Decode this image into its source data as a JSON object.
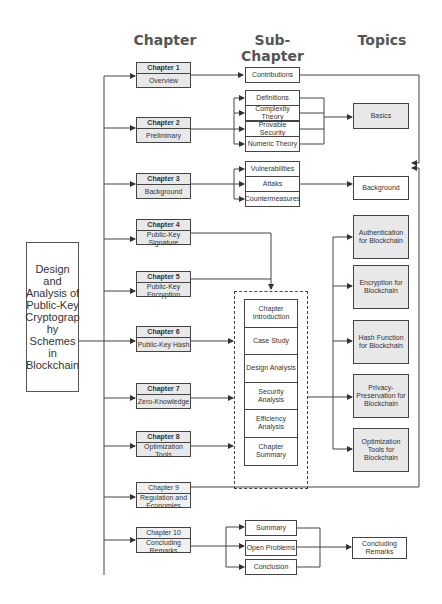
{
  "headers": {
    "chapter": "Chapter",
    "subchapter": "Sub-Chapter",
    "topics": "Topics"
  },
  "main_title": "Design and Analysis of Public-Key Cryptograp hy Schemes in Blockchain",
  "chapters": [
    {
      "title": "Chapter 1",
      "subtitle": "Overview"
    },
    {
      "title": "Chapter 2",
      "subtitle": "Preliminary"
    },
    {
      "title": "Chapter 3",
      "subtitle": "Background"
    },
    {
      "title": "Chapter 4",
      "subtitle": "Public-Key Signature"
    },
    {
      "title": "Chapter 5",
      "subtitle": "Public-Key Encryption"
    },
    {
      "title": "Chapter 6",
      "subtitle": "Public-Key Hash"
    },
    {
      "title": "Chapter 7",
      "subtitle": "Zero-Knowledge"
    },
    {
      "title": "Chapter 8",
      "subtitle": "Optimization Tools"
    },
    {
      "title": "Chapter 9",
      "subtitle": "Regulation and Economies"
    },
    {
      "title": "Chapter 10",
      "subtitle": "Concluding Remarks"
    }
  ],
  "subchapters": {
    "ch1": [
      "Contributions"
    ],
    "ch2": [
      "Definitions",
      "Complexity Theory",
      "Provable Security",
      "Numeric Theory"
    ],
    "ch3": [
      "Vulnerabilities",
      "Attaks",
      "Countermeasures"
    ],
    "core": [
      "Chapter Introduction",
      "Case Study",
      "Design Analysis",
      "Security Analysis",
      "Efficiency Analysis",
      "Chapter Summary"
    ],
    "ch10": [
      "Summary",
      "Open Problems",
      "Conclusion"
    ]
  },
  "topics": [
    "Basics",
    "Background",
    "Authentication for Blockchain",
    "Encryption for Blockchain",
    "Hash Function for Blockchain",
    "Privacy-Preservation for Blockchain",
    "Optimization Tools for Blockchain",
    "Concluding Remarks"
  ]
}
